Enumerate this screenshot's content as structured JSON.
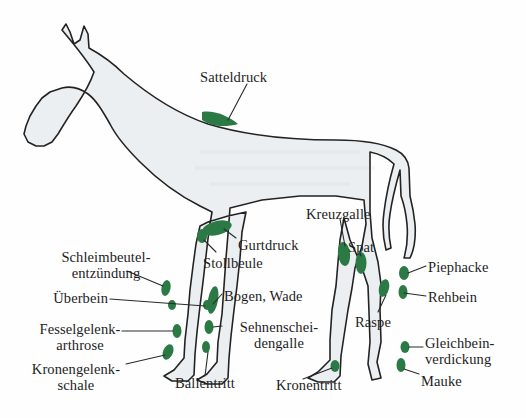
{
  "figure": {
    "background_color": "#fefefe",
    "body_fill_color": "#eceff1",
    "outline_color": "#232323",
    "marker_color": "#2b7a45",
    "leader_line_color": "#2a2a2a",
    "text_color": "#1d1d1d"
  },
  "labels": [
    {
      "id": "satteldruck",
      "text": "Satteldruck",
      "x": 200,
      "y": 70,
      "align": "left"
    },
    {
      "id": "kreuzgalle",
      "text": "Kreuzgalle",
      "x": 306,
      "y": 207,
      "align": "left"
    },
    {
      "id": "gurtdruck",
      "text": "Gurtdruck",
      "x": 238,
      "y": 238,
      "align": "left"
    },
    {
      "id": "spat",
      "text": "Spat",
      "x": 348,
      "y": 243,
      "align": "left"
    },
    {
      "id": "stollbeule",
      "text": "Stollbeule",
      "x": 203,
      "y": 257,
      "align": "left"
    },
    {
      "id": "schleimbeutelentzuendung",
      "text": "Schleimbeutel-\nentzündung",
      "x": 43,
      "y": 250,
      "align": "left"
    },
    {
      "id": "piephacke",
      "text": "Piephacke",
      "x": 428,
      "y": 261,
      "align": "left"
    },
    {
      "id": "bogen-wade",
      "text": "Bogen, Wade",
      "x": 224,
      "y": 290,
      "align": "left"
    },
    {
      "id": "ueberbein",
      "text": "Überbein",
      "x": 58,
      "y": 292,
      "align": "left"
    },
    {
      "id": "rehbein",
      "text": "Rehbein",
      "x": 428,
      "y": 291,
      "align": "left"
    },
    {
      "id": "sehnenscheidengalle",
      "text": "Sehnenschei-\ndengalle",
      "x": 224,
      "y": 321,
      "align": "left"
    },
    {
      "id": "fesselgelenkarthrose",
      "text": "Fesselgelenk-\narthrose",
      "x": 43,
      "y": 323,
      "align": "left"
    },
    {
      "id": "raspe",
      "text": "Raspe",
      "x": 358,
      "y": 318,
      "align": "left"
    },
    {
      "id": "gleichbeinverdickung",
      "text": "Gleichbein-\nverdickung",
      "x": 425,
      "y": 337,
      "align": "left"
    },
    {
      "id": "kronengelenkschale",
      "text": "Kronengelenk-\nschale",
      "x": 38,
      "y": 364,
      "align": "left"
    },
    {
      "id": "ballentritt",
      "text": "Ballentritt",
      "x": 176,
      "y": 379,
      "align": "left"
    },
    {
      "id": "mauke",
      "text": "Mauke",
      "x": 421,
      "y": 377,
      "align": "left"
    },
    {
      "id": "kronentritt",
      "text": "Kronentritt",
      "x": 277,
      "y": 381,
      "align": "left"
    }
  ]
}
